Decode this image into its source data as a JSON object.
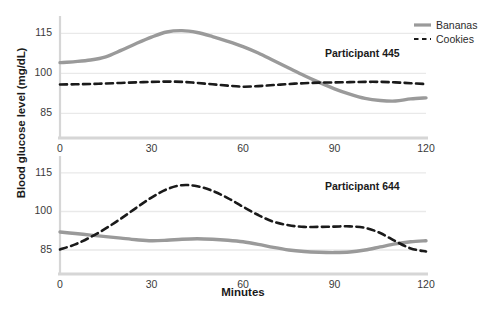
{
  "chart_data": {
    "type": "line",
    "title": "",
    "xlabel": "Minutes",
    "ylabel": "Blood glucose level (mg/dL)",
    "xlim": [
      0,
      120
    ],
    "ylim": [
      78,
      120
    ],
    "xticks": [
      0,
      30,
      60,
      90,
      120
    ],
    "yticks": [
      85,
      100,
      115
    ],
    "grid": true,
    "legend_position": "top-right",
    "legend": [
      "Bananas",
      "Cookies"
    ],
    "colors": {
      "bananas": "#9a9a9a",
      "cookies": "#1a1a1a",
      "grid": "#e9e9e9",
      "axis": "#d6d6d6"
    },
    "panels": [
      {
        "label": "Participant 445",
        "x": [
          0,
          5,
          10,
          15,
          20,
          25,
          30,
          35,
          40,
          45,
          50,
          55,
          60,
          65,
          70,
          75,
          80,
          85,
          90,
          95,
          100,
          105,
          110,
          115,
          120
        ],
        "series": [
          {
            "name": "Bananas",
            "style": "solid",
            "color": "#9a9a9a",
            "values": [
              104.0,
              104.4,
              105.0,
              106.2,
              108.6,
              111.2,
              113.6,
              115.5,
              116.0,
              115.3,
              113.8,
              112.0,
              110.0,
              107.6,
              104.8,
              102.0,
              99.2,
              96.6,
              94.2,
              92.2,
              90.6,
              89.8,
              89.6,
              90.4,
              90.8
            ]
          },
          {
            "name": "Cookies",
            "style": "dashed",
            "color": "#1a1a1a",
            "values": [
              95.8,
              95.9,
              96.0,
              96.2,
              96.4,
              96.6,
              96.8,
              96.9,
              96.8,
              96.4,
              95.9,
              95.4,
              95.0,
              95.2,
              95.6,
              96.0,
              96.3,
              96.5,
              96.6,
              96.7,
              96.8,
              96.8,
              96.6,
              96.3,
              96.0
            ]
          }
        ]
      },
      {
        "label": "Participant 644",
        "x": [
          0,
          5,
          10,
          15,
          20,
          25,
          30,
          35,
          40,
          45,
          50,
          55,
          60,
          65,
          70,
          75,
          80,
          85,
          90,
          95,
          100,
          105,
          110,
          115,
          120
        ],
        "series": [
          {
            "name": "Bananas",
            "style": "solid",
            "color": "#9a9a9a",
            "values": [
              92.0,
              91.4,
              90.8,
              90.2,
              89.6,
              89.0,
              88.6,
              88.8,
              89.2,
              89.4,
              89.2,
              88.8,
              88.2,
              87.2,
              86.0,
              85.0,
              84.4,
              84.1,
              84.0,
              84.2,
              85.0,
              86.2,
              87.4,
              88.2,
              88.6
            ]
          },
          {
            "name": "Cookies",
            "style": "dashed",
            "color": "#1a1a1a",
            "values": [
              85.2,
              87.2,
              90.0,
              93.4,
              97.2,
              101.4,
              105.4,
              108.6,
              110.2,
              109.8,
              108.0,
              105.2,
              101.8,
              98.6,
              96.0,
              94.6,
              94.0,
              94.0,
              94.1,
              94.2,
              93.6,
              91.6,
              88.4,
              85.6,
              84.4
            ]
          }
        ]
      }
    ]
  },
  "axis": {
    "ylabel": "Blood glucose level (mg/dL)",
    "xlabel": "Minutes",
    "yticks": [
      "115",
      "100",
      "85"
    ],
    "xticks": [
      "0",
      "30",
      "60",
      "90",
      "120"
    ]
  },
  "legend": {
    "items": [
      {
        "label": "Bananas",
        "style": "solid"
      },
      {
        "label": "Cookies",
        "style": "dashed"
      }
    ]
  },
  "panels": {
    "top_label": "Participant 445",
    "bottom_label": "Participant 644"
  }
}
